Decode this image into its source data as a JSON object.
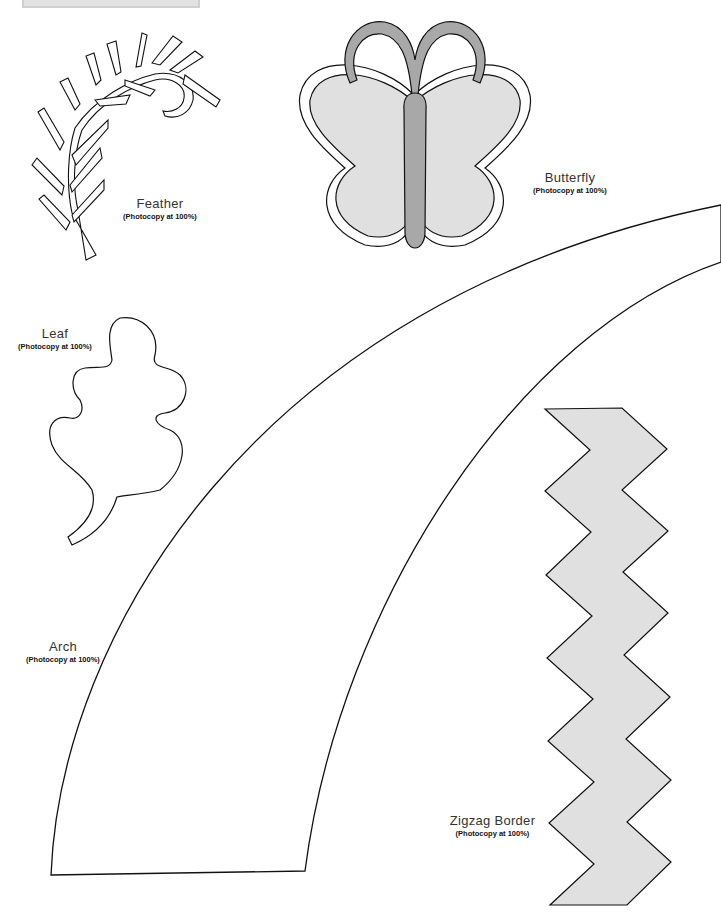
{
  "templates": [
    {
      "id": "feather",
      "name": "Feather",
      "note": "(Photocopy at 100%)"
    },
    {
      "id": "butterfly",
      "name": "Butterfly",
      "note": "(Photocopy at 100%)"
    },
    {
      "id": "leaf",
      "name": "Leaf",
      "note": "(Photocopy at 100%)"
    },
    {
      "id": "arch",
      "name": "Arch",
      "note": "(Photocopy at 100%)"
    },
    {
      "id": "zigzag",
      "name": "Zigzag Border",
      "note": "(Photocopy at 100%)"
    }
  ],
  "colors": {
    "outline": "#111111",
    "fill_light": "#e0e0e0",
    "fill_dark": "#a8a8a8",
    "background": "#ffffff"
  }
}
